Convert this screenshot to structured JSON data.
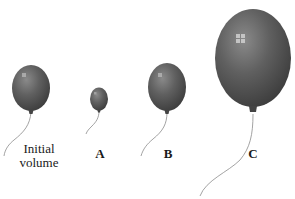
{
  "figure": {
    "balloon_color": "#555555",
    "string_color": "#888888",
    "balloons": [
      {
        "id": "initial",
        "label_line1": "Initial",
        "label_line2": "volume",
        "relative_size": "medium"
      },
      {
        "id": "A",
        "label": "A",
        "relative_size": "small"
      },
      {
        "id": "B",
        "label": "B",
        "relative_size": "medium"
      },
      {
        "id": "C",
        "label": "C",
        "relative_size": "large"
      }
    ]
  }
}
